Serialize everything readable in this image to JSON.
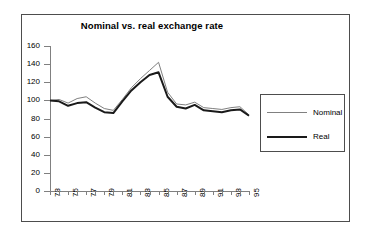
{
  "chart_data": {
    "type": "line",
    "title": "Nominal vs. real exchange rate",
    "xlabel": "",
    "ylabel": "",
    "ylim": [
      0,
      160
    ],
    "ytick_step": 20,
    "yticks": [
      "0",
      "20",
      "40",
      "60",
      "80",
      "100",
      "120",
      "140",
      "160"
    ],
    "grid": false,
    "legend_position": "right",
    "x": [
      73,
      74,
      75,
      76,
      77,
      78,
      79,
      80,
      81,
      82,
      83,
      84,
      85,
      86,
      87,
      88,
      89,
      90,
      91,
      92,
      93,
      94,
      95
    ],
    "xtick_labels": [
      "73",
      "",
      "75",
      "",
      "77",
      "",
      "79",
      "",
      "81",
      "",
      "83",
      "",
      "85",
      "",
      "87",
      "",
      "89",
      "",
      "91",
      "",
      "93",
      "",
      "95"
    ],
    "xtick_labels_visible": [
      "73",
      "75",
      "77",
      "79",
      "81",
      "83",
      "85",
      "87",
      "89",
      "91",
      "93",
      "95"
    ],
    "series": [
      {
        "name": "Nominal",
        "color": "#808080",
        "width": 1,
        "values": [
          100,
          101,
          97,
          102,
          104,
          97,
          91,
          89,
          101,
          114,
          124,
          133,
          142,
          109,
          96,
          95,
          98,
          92,
          91,
          90,
          92,
          93,
          84
        ]
      },
      {
        "name": "Real",
        "color": "#1a1a1a",
        "width": 2,
        "values": [
          100,
          99,
          94,
          97,
          98,
          92,
          87,
          86,
          99,
          111,
          120,
          128,
          131,
          104,
          93,
          91,
          95,
          89,
          88,
          87,
          89,
          90,
          83
        ]
      }
    ]
  },
  "legend": {
    "items": [
      {
        "label": "Nominal"
      },
      {
        "label": "Real"
      }
    ]
  },
  "colors": {
    "nominal": "#808080",
    "real": "#1a1a1a",
    "axis": "#808080",
    "frame": "#4d4d4d",
    "background": "#ffffff"
  }
}
